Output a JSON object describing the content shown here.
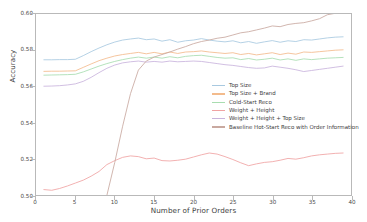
{
  "chart_data": {
    "type": "line",
    "title": "",
    "xlabel": "Number of Prior Orders",
    "ylabel": "Accuracy",
    "xlim": [
      0,
      40
    ],
    "ylim": [
      0.5,
      0.6
    ],
    "xticks": [
      0,
      5,
      10,
      15,
      20,
      25,
      30,
      35,
      40
    ],
    "xticklabels": [
      "0",
      "5",
      "10",
      "15",
      "20",
      "25",
      "30",
      "35",
      "40"
    ],
    "yticks": [
      0.5,
      0.52,
      0.54,
      0.56,
      0.58,
      0.6
    ],
    "yticklabels": [
      "0.50",
      "0.52",
      "0.54",
      "0.56",
      "0.58",
      "0.60"
    ],
    "grid": false,
    "legend_position": "center-right",
    "x": [
      1,
      2,
      3,
      4,
      5,
      6,
      7,
      8,
      9,
      10,
      11,
      12,
      13,
      14,
      15,
      16,
      17,
      18,
      19,
      20,
      21,
      22,
      23,
      24,
      25,
      26,
      27,
      28,
      29,
      30,
      31,
      32,
      33,
      34,
      35,
      36,
      37,
      38,
      39
    ],
    "series": [
      {
        "name": "Top Size",
        "color": "#a8c9e0",
        "values": [
          0.5747,
          0.5747,
          0.5748,
          0.5748,
          0.575,
          0.577,
          0.5792,
          0.5812,
          0.583,
          0.5845,
          0.5856,
          0.5862,
          0.5867,
          0.5858,
          0.5862,
          0.585,
          0.5858,
          0.5844,
          0.5852,
          0.5856,
          0.5864,
          0.5856,
          0.585,
          0.5846,
          0.5852,
          0.5841,
          0.5848,
          0.5838,
          0.5846,
          0.5853,
          0.5844,
          0.5852,
          0.5848,
          0.5858,
          0.5856,
          0.5862,
          0.5868,
          0.5872,
          0.5874
        ]
      },
      {
        "name": "Top Size + Brand",
        "color": "#f3bb8c",
        "values": [
          0.5683,
          0.5684,
          0.5684,
          0.5685,
          0.5686,
          0.5705,
          0.5724,
          0.5742,
          0.5756,
          0.5768,
          0.5776,
          0.5782,
          0.5788,
          0.578,
          0.5788,
          0.578,
          0.579,
          0.5782,
          0.579,
          0.5792,
          0.5796,
          0.579,
          0.5786,
          0.5782,
          0.5786,
          0.5776,
          0.5782,
          0.5774,
          0.578,
          0.5786,
          0.5776,
          0.5784,
          0.5778,
          0.579,
          0.5788,
          0.5792,
          0.5796,
          0.58,
          0.5802
        ]
      },
      {
        "name": "Cold-Start Reco",
        "color": "#a8ddb0",
        "values": [
          0.5662,
          0.5663,
          0.5664,
          0.5665,
          0.5667,
          0.568,
          0.5696,
          0.5712,
          0.5726,
          0.5738,
          0.5748,
          0.5756,
          0.5762,
          0.5756,
          0.5762,
          0.5756,
          0.5764,
          0.5758,
          0.5766,
          0.577,
          0.5772,
          0.5766,
          0.576,
          0.5756,
          0.5758,
          0.5748,
          0.5754,
          0.5746,
          0.575,
          0.5756,
          0.5746,
          0.5752,
          0.5744,
          0.5752,
          0.5748,
          0.5752,
          0.5756,
          0.5758,
          0.576
        ]
      },
      {
        "name": "Weight + Height",
        "color": "#f0a3a3",
        "values": [
          0.503,
          0.5026,
          0.5036,
          0.505,
          0.5066,
          0.5082,
          0.5104,
          0.513,
          0.5168,
          0.519,
          0.5208,
          0.5216,
          0.5212,
          0.52,
          0.5204,
          0.519,
          0.5188,
          0.5192,
          0.5198,
          0.521,
          0.5222,
          0.5232,
          0.5226,
          0.5212,
          0.5196,
          0.5178,
          0.5162,
          0.5172,
          0.518,
          0.5184,
          0.5192,
          0.5202,
          0.5198,
          0.5206,
          0.5216,
          0.5222,
          0.5226,
          0.523,
          0.5232
        ]
      },
      {
        "name": "Weight + Height + Top Size",
        "color": "#c9b4dd",
        "values": [
          0.5601,
          0.5602,
          0.5604,
          0.5608,
          0.5614,
          0.5628,
          0.565,
          0.5676,
          0.57,
          0.5718,
          0.573,
          0.5736,
          0.574,
          0.5734,
          0.5738,
          0.5734,
          0.574,
          0.5736,
          0.5738,
          0.574,
          0.5738,
          0.5732,
          0.5726,
          0.572,
          0.5716,
          0.571,
          0.5704,
          0.57,
          0.5702,
          0.5712,
          0.5706,
          0.57,
          0.5692,
          0.5682,
          0.5688,
          0.5694,
          0.57,
          0.5706,
          0.5712
        ]
      },
      {
        "name": "Baseline Hot-Start Reco with Order Information",
        "color": "#c9a9a0",
        "values": [
          null,
          null,
          null,
          null,
          null,
          null,
          null,
          null,
          0.4998,
          0.518,
          0.538,
          0.556,
          0.569,
          0.574,
          0.5762,
          0.5776,
          0.579,
          0.5806,
          0.582,
          0.5836,
          0.5848,
          0.5856,
          0.5866,
          0.5872,
          0.5884,
          0.5896,
          0.5902,
          0.5912,
          0.5922,
          0.5934,
          0.593,
          0.5942,
          0.5948,
          0.5952,
          0.5962,
          0.5974,
          0.5996,
          0.6004,
          0.6008
        ]
      }
    ]
  },
  "legend": {
    "items": [
      {
        "label": "Top Size"
      },
      {
        "label": "Top Size + Brand"
      },
      {
        "label": "Cold-Start Reco"
      },
      {
        "label": "Weight + Height"
      },
      {
        "label": "Weight + Height + Top Size"
      },
      {
        "label": "Baseline Hot-Start Reco with Order Information"
      }
    ]
  }
}
